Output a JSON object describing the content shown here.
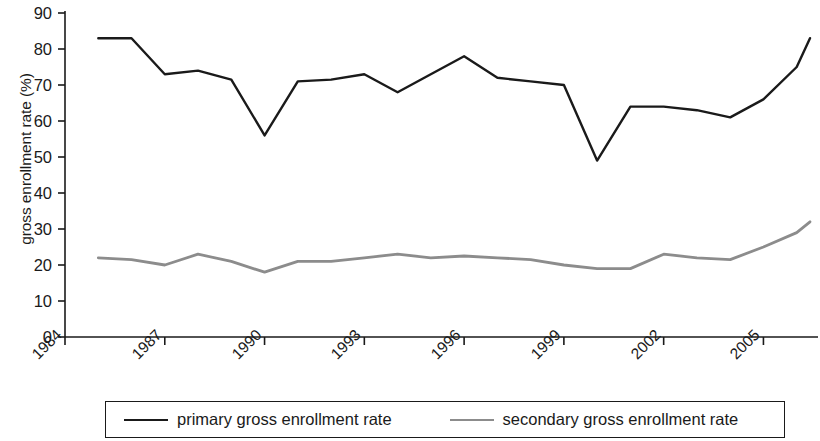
{
  "chart_data": {
    "type": "line",
    "title": "",
    "xlabel": "",
    "ylabel": "gross enrollment rate (%)",
    "xlim": [
      1984,
      2006
    ],
    "ylim": [
      0,
      90
    ],
    "grid": false,
    "legend_position": "bottom",
    "x_ticks": [
      "1984",
      "1987",
      "1990",
      "1993",
      "1996",
      "1999",
      "2002",
      "2005"
    ],
    "x_tick_values": [
      1984,
      1987,
      1990,
      1993,
      1996,
      1999,
      2002,
      2005
    ],
    "y_ticks": [
      "0",
      "10",
      "20",
      "30",
      "40",
      "50",
      "60",
      "70",
      "80",
      "90"
    ],
    "y_tick_values": [
      0,
      10,
      20,
      30,
      40,
      50,
      60,
      70,
      80,
      90
    ],
    "x": [
      1985,
      1986,
      1987,
      1988,
      1989,
      1990,
      1991,
      1992,
      1993,
      1994,
      1995,
      1996,
      1997,
      1998,
      1999,
      2000,
      2001,
      2002,
      2003,
      2004,
      2005,
      2006
    ],
    "series": [
      {
        "name": "primary gross enrollment rate",
        "color": "#1a1a1a",
        "values": [
          83,
          83,
          73,
          74,
          71.5,
          56,
          71,
          71.5,
          73,
          68,
          73,
          78,
          72,
          71,
          70,
          49,
          64,
          64,
          63,
          61,
          66,
          75
        ]
      },
      {
        "name": "secondary gross enrollment rate",
        "color": "#8c8c8c",
        "values": [
          22,
          21.5,
          20,
          23,
          21,
          18,
          21,
          21,
          22,
          23,
          22,
          22.5,
          22,
          21.5,
          20,
          19,
          19,
          23,
          22,
          21.5,
          25,
          29
        ]
      }
    ],
    "series_extra_points": [
      {
        "name": "primary gross enrollment rate",
        "x": 2006.4,
        "y": 83
      },
      {
        "name": "secondary gross enrollment rate",
        "x": 2006.4,
        "y": 32
      }
    ]
  },
  "legend": {
    "entries": [
      {
        "label": "primary gross enrollment rate",
        "swatch": "primary-line-swatch"
      },
      {
        "label": "secondary gross enrollment rate",
        "swatch": "secondary-line-swatch"
      }
    ]
  },
  "colors": {
    "primary_line": "#1a1a1a",
    "secondary_line": "#8c8c8c",
    "axis": "#1a1a1a",
    "background": "#ffffff"
  }
}
